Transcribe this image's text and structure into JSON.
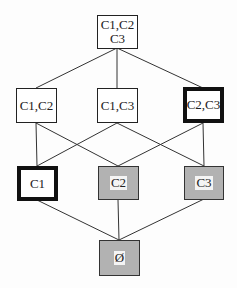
{
  "diagram": {
    "type": "lattice",
    "colors": {
      "line": "#333333",
      "shaded_fill": "#b2b2b2",
      "border": "#222222"
    },
    "nodes": [
      {
        "id": "c1c2c3",
        "label": "C1,C2\nC3",
        "x": 97,
        "y": 15,
        "w": 41,
        "h": 34,
        "style": "normal"
      },
      {
        "id": "c1c2",
        "label": "C1,C2",
        "x": 16,
        "y": 88,
        "w": 41,
        "h": 35,
        "style": "normal"
      },
      {
        "id": "c1c3",
        "label": "C1,C3",
        "x": 97,
        "y": 88,
        "w": 41,
        "h": 35,
        "style": "normal"
      },
      {
        "id": "c2c3",
        "label": "C2,C3",
        "x": 183,
        "y": 87,
        "w": 41,
        "h": 36,
        "style": "bold"
      },
      {
        "id": "c1",
        "label": "C1",
        "x": 17,
        "y": 166,
        "w": 41,
        "h": 35,
        "style": "bold"
      },
      {
        "id": "c2",
        "label": "C2",
        "x": 98,
        "y": 166,
        "w": 41,
        "h": 34,
        "style": "shaded"
      },
      {
        "id": "c3",
        "label": "C3",
        "x": 184,
        "y": 166,
        "w": 40,
        "h": 34,
        "style": "shaded"
      },
      {
        "id": "empty",
        "label": "Ø",
        "x": 99,
        "y": 240,
        "w": 41,
        "h": 36,
        "style": "shaded"
      }
    ],
    "edges": [
      {
        "x1": 117,
        "y1": 48,
        "x2": 36,
        "y2": 88
      },
      {
        "x1": 117,
        "y1": 48,
        "x2": 117,
        "y2": 88
      },
      {
        "x1": 117,
        "y1": 48,
        "x2": 203,
        "y2": 88
      },
      {
        "x1": 36,
        "y1": 123,
        "x2": 37,
        "y2": 166
      },
      {
        "x1": 36,
        "y1": 123,
        "x2": 118,
        "y2": 166
      },
      {
        "x1": 117,
        "y1": 123,
        "x2": 37,
        "y2": 166
      },
      {
        "x1": 117,
        "y1": 123,
        "x2": 204,
        "y2": 166
      },
      {
        "x1": 203,
        "y1": 123,
        "x2": 118,
        "y2": 166
      },
      {
        "x1": 203,
        "y1": 123,
        "x2": 204,
        "y2": 166
      },
      {
        "x1": 37,
        "y1": 200,
        "x2": 119,
        "y2": 240
      },
      {
        "x1": 118,
        "y1": 200,
        "x2": 119,
        "y2": 240
      },
      {
        "x1": 204,
        "y1": 199,
        "x2": 119,
        "y2": 240
      }
    ]
  }
}
